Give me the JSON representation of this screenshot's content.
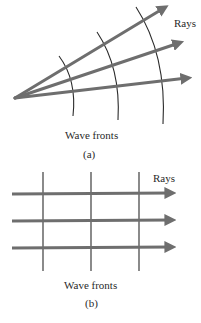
{
  "figure": {
    "panel_a": {
      "rays_label": "Rays",
      "wavefronts_label": "Wave fronts",
      "caption": "(a)",
      "description": "Spherical wave: rays diverge radially from a point source; wave fronts are concentric arcs"
    },
    "panel_b": {
      "rays_label": "Rays",
      "wavefronts_label": "Wave fronts",
      "caption": "(b)",
      "description": "Plane wave: parallel rays; wave fronts are parallel straight lines"
    }
  },
  "colors": {
    "ray": "#6e6e6e",
    "wavefront": "#2b2b2b",
    "text": "#2a2a2a",
    "background": "#ffffff"
  }
}
